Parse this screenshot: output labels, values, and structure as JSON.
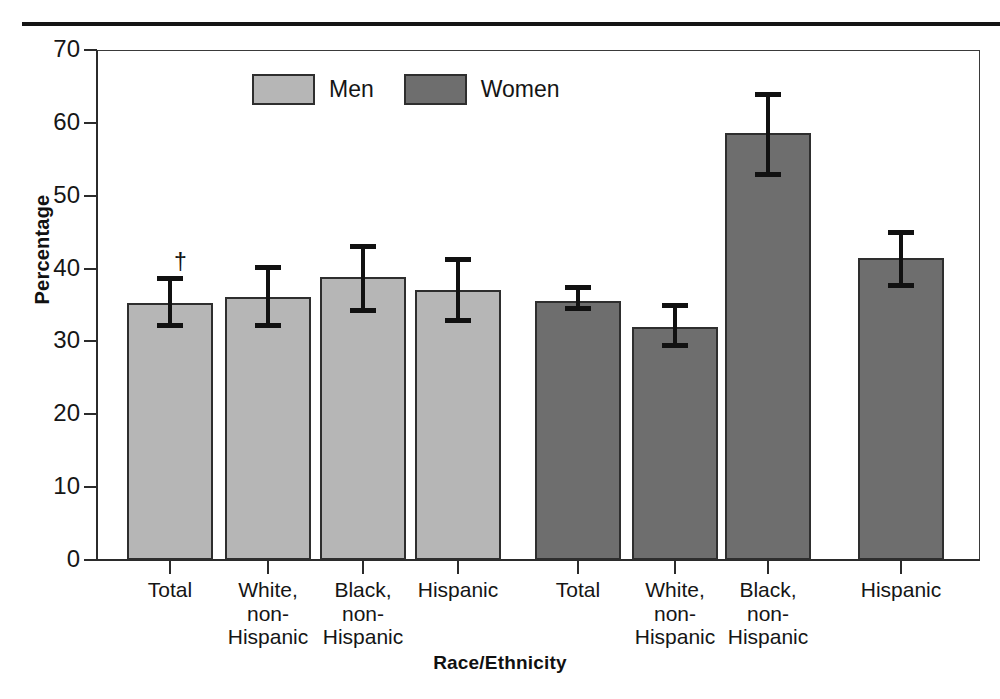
{
  "figure": {
    "top_rule": true,
    "footnote_marker": "†"
  },
  "legend": {
    "position": "top-center",
    "items": [
      {
        "label": "Men",
        "color": "#b6b6b6",
        "swatch": "men-swatch"
      },
      {
        "label": "Women",
        "color": "#6e6e6e",
        "swatch": "women-swatch"
      }
    ]
  },
  "axes": {
    "ylabel": "Percentage",
    "xlabel": "Race/Ethnicity",
    "yticks": [
      0,
      10,
      20,
      30,
      40,
      50,
      60,
      70
    ],
    "ylim": [
      0,
      70
    ]
  },
  "chart_data": {
    "type": "bar",
    "title": "",
    "subtitle": "",
    "xlabel": "Race/Ethnicity",
    "ylabel": "Percentage",
    "ylim": [
      0,
      70
    ],
    "ytick_labels": [
      "0",
      "10",
      "20",
      "30",
      "40",
      "50",
      "60",
      "70"
    ],
    "grid": false,
    "legend_position": "top-center",
    "annotations": [
      {
        "text": "†",
        "attached_to": "Men / Total",
        "note": "dagger symbol above first bar's error bar"
      }
    ],
    "groups": [
      "Men",
      "Women"
    ],
    "categories": [
      "Total",
      "White, non-Hispanic",
      "Black, non-Hispanic",
      "Hispanic"
    ],
    "category_labels_multiline": [
      [
        "Total"
      ],
      [
        "White,",
        "non-",
        "Hispanic"
      ],
      [
        "Black,",
        "non-",
        "Hispanic"
      ],
      [
        "Hispanic"
      ]
    ],
    "series": [
      {
        "name": "Men",
        "color": "#b6b6b6",
        "values": [
          35.3,
          36.1,
          38.8,
          37.0
        ],
        "errors_low": [
          31.8,
          31.8,
          33.9,
          32.5
        ],
        "errors_high": [
          39.0,
          40.5,
          43.4,
          41.6
        ]
      },
      {
        "name": "Women",
        "color": "#6e6e6e",
        "values": [
          35.6,
          32.0,
          58.6,
          41.4
        ],
        "errors_low": [
          34.2,
          29.1,
          52.6,
          37.3
        ],
        "errors_high": [
          37.7,
          35.3,
          64.2,
          45.3
        ]
      }
    ],
    "bars": [
      {
        "group": "Men",
        "category": "Total",
        "value": 35.3,
        "ci_low": 31.8,
        "ci_high": 39.0,
        "marker": "†"
      },
      {
        "group": "Men",
        "category": "White, non-Hispanic",
        "value": 36.1,
        "ci_low": 31.8,
        "ci_high": 40.5
      },
      {
        "group": "Men",
        "category": "Black, non-Hispanic",
        "value": 38.8,
        "ci_low": 33.9,
        "ci_high": 43.4
      },
      {
        "group": "Men",
        "category": "Hispanic",
        "value": 37.0,
        "ci_low": 32.5,
        "ci_high": 41.6
      },
      {
        "group": "Women",
        "category": "Total",
        "value": 35.6,
        "ci_low": 34.2,
        "ci_high": 37.7
      },
      {
        "group": "Women",
        "category": "White, non-Hispanic",
        "value": 32.0,
        "ci_low": 29.1,
        "ci_high": 35.3
      },
      {
        "group": "Women",
        "category": "Black, non-Hispanic",
        "value": 58.6,
        "ci_low": 52.6,
        "ci_high": 64.2
      },
      {
        "group": "Women",
        "category": "Hispanic",
        "value": 41.4,
        "ci_low": 37.3,
        "ci_high": 45.3
      }
    ]
  }
}
